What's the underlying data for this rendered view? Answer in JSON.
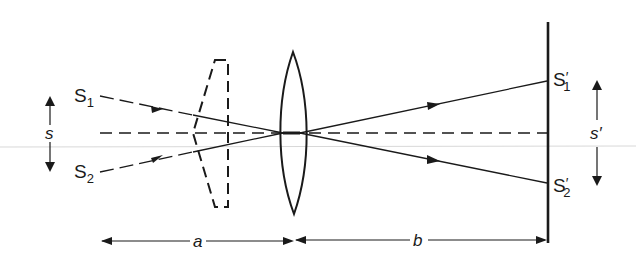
{
  "diagram": {
    "labels": {
      "source1": "S",
      "source1_sub": "1",
      "source2": "S",
      "source2_sub": "2",
      "image1": "S",
      "image1_prime": "′",
      "image1_sub": "1",
      "image2": "S",
      "image2_prime": "′",
      "image2_sub": "2",
      "source_separation": "s",
      "image_separation": "s′",
      "object_distance": "a",
      "image_distance": "b"
    },
    "elements": {
      "lens": "converging-lens",
      "dashed_lens": "diverging-lens-outline",
      "screen": "screen",
      "optical_axis": "dashed-axis",
      "rays": [
        "ray-S1-to-S1prime",
        "ray-S2-to-S2prime"
      ]
    },
    "colors": {
      "ink": "#1a1a1a",
      "scan_line": "#d8d8d8"
    }
  }
}
